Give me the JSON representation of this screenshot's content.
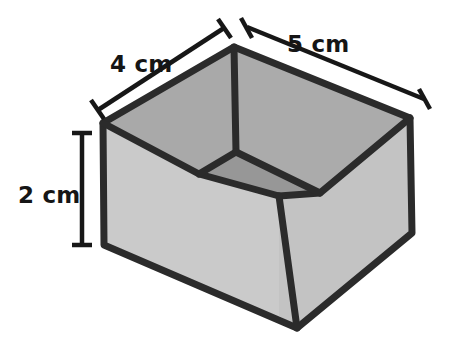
{
  "figure": {
    "type": "geometric-solid-diagram",
    "shape": "rectangular prism (open top box)",
    "projection": "parallel / isometric-style",
    "background_color": "#ffffff",
    "colors": {
      "outline": "#2b2b2b",
      "outer_face_light": "#c9c9c9",
      "outer_face_front_right": "#c2c2c2",
      "inner_wall": "#a9a9a9",
      "inner_wall_right": "#b0b0b0",
      "inner_floor": "#979797",
      "label_text": "#151515"
    },
    "dimensions": [
      {
        "id": "depth",
        "label": "4 cm",
        "value": 4,
        "unit": "cm",
        "edge": "top-left back edge",
        "label_position": "upper-left",
        "leader_style": "double-ended line with flat serif caps"
      },
      {
        "id": "width",
        "label": "5 cm",
        "value": 5,
        "unit": "cm",
        "edge": "top-right back edge",
        "label_position": "upper-right",
        "leader_style": "double-ended line with flat serif caps"
      },
      {
        "id": "height",
        "label": "2 cm",
        "value": 2,
        "unit": "cm",
        "edge": "left vertical edge",
        "label_position": "left",
        "leader_style": "vertical line with flat serif caps"
      }
    ],
    "geometry": {
      "top_rim": {
        "left": [
          103,
          123
        ],
        "back": [
          234,
          47
        ],
        "right": [
          410,
          118
        ],
        "front": [
          279,
          196
        ]
      },
      "bottom_outer": {
        "left": [
          104,
          245
        ],
        "front": [
          297,
          328
        ],
        "right": [
          412,
          233
        ]
      },
      "inner_floor": {
        "left": [
          199,
          174
        ],
        "back": [
          236,
          152
        ],
        "right": [
          320,
          193
        ],
        "front": [
          279,
          196
        ]
      }
    },
    "leader_lines": {
      "depth": {
        "from": [
          98,
          110
        ],
        "to": [
          224,
          28
        ]
      },
      "width": {
        "from": [
          247,
          27
        ],
        "to": [
          424,
          99
        ]
      },
      "height": {
        "from": [
          82,
          133
        ],
        "to": [
          82,
          245
        ]
      }
    },
    "label_anchors": {
      "depth": [
        110,
        65
      ],
      "width": [
        287,
        45
      ],
      "height": [
        20,
        202
      ]
    }
  }
}
